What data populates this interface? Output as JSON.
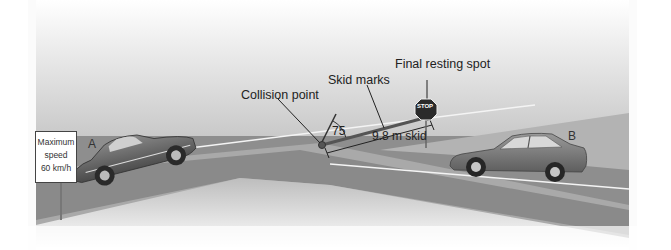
{
  "diagram": {
    "callouts": {
      "collision_point": "Collision point",
      "skid_marks": "Skid marks",
      "final_resting_spot": "Final resting spot"
    },
    "measurements": {
      "angle": "75",
      "skid_length": "9.8 m skid"
    },
    "vehicles": {
      "car_a": "A",
      "car_b": "B"
    },
    "speed_sign": {
      "line1": "Maximum",
      "line2": "speed",
      "line3": "60 km/h"
    },
    "stop_sign": "STOP",
    "colors": {
      "sky_top": "#ffffff",
      "sky_horizon": "#c8c8c8",
      "road": "#8c8c8c",
      "ground_light": "#c4c4c4",
      "car_a": "#6a6a6a",
      "car_b": "#7a7a7a",
      "stop_sign": "#2a2a2a"
    }
  }
}
